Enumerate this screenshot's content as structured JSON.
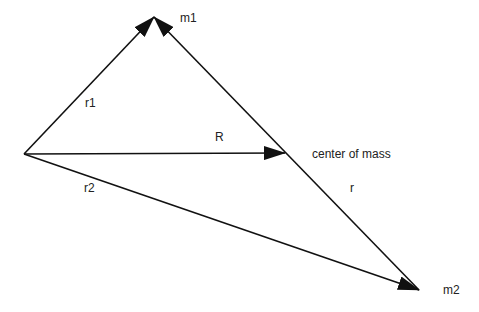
{
  "diagram": {
    "labels": {
      "m1": "m1",
      "m2": "m2",
      "r1": "r1",
      "r2": "r2",
      "R": "R",
      "r": "r",
      "center_of_mass": "center of mass"
    },
    "points": {
      "origin": [
        24,
        154
      ],
      "m1": [
        154,
        17
      ],
      "m2": [
        419,
        290
      ],
      "center_of_mass": [
        285,
        153
      ]
    },
    "colors": {
      "line": "#111111",
      "background": "#ffffff"
    }
  }
}
